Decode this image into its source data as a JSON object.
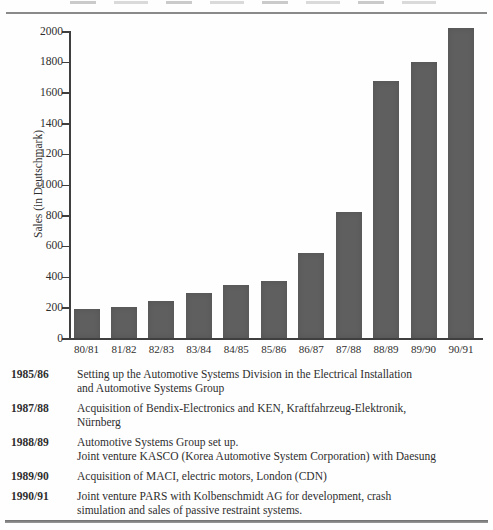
{
  "chart_data": {
    "type": "bar",
    "title": "",
    "xlabel": "",
    "ylabel": "Sales (in Deutschmark)",
    "categories": [
      "80/81",
      "81/82",
      "82/83",
      "83/84",
      "84/85",
      "85/86",
      "86/87",
      "87/88",
      "88/89",
      "89/90",
      "90/91"
    ],
    "values": [
      190,
      205,
      240,
      295,
      345,
      370,
      555,
      820,
      1675,
      1800,
      2020
    ],
    "ylim": [
      0,
      2000
    ],
    "yticks": [
      0,
      200,
      400,
      600,
      800,
      1000,
      1200,
      1400,
      1600,
      1800,
      2000
    ],
    "grid": false,
    "legend": "none",
    "bar_color": "#5f5f5f"
  },
  "timeline": {
    "entries": [
      {
        "year": "1985/86",
        "text": "Setting up the Automotive Systems Division in the Electrical Installation\nand Automotive Systems Group"
      },
      {
        "year": "1987/88",
        "text": "Acquisition of Bendix-Electronics and KEN, Kraftfahrzeug-Elektronik,\nNürnberg"
      },
      {
        "year": "1988/89",
        "text": "Automotive Systems Group set up.\nJoint venture KASCO (Korea Automotive System Corporation) with Daesung"
      },
      {
        "year": "1989/90",
        "text": "Acquisition of MACI, electric motors, London (CDN)"
      },
      {
        "year": "1990/91",
        "text": "Joint venture PARS with Kolbenschmidt AG for development, crash\nsimulation and sales of passive restraint systems."
      }
    ]
  }
}
